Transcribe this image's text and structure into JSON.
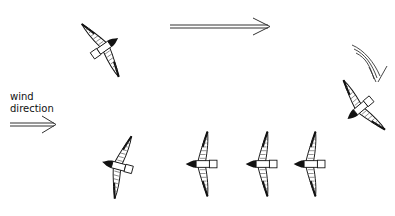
{
  "diagram": {
    "label_line1": "wind",
    "label_line2": "direction",
    "arrows": [
      {
        "name": "wind-direction-arrow",
        "direction": "right"
      },
      {
        "name": "flight-path-arrow",
        "direction": "right"
      },
      {
        "name": "turn-arrow",
        "direction": "curved-down"
      }
    ],
    "birds": [
      {
        "id": 1,
        "position": "top-left",
        "heading": "up-right"
      },
      {
        "id": 2,
        "position": "right",
        "heading": "down-left"
      },
      {
        "id": 3,
        "position": "bottom-right-4",
        "heading": "left"
      },
      {
        "id": 4,
        "position": "bottom-right-3",
        "heading": "left"
      },
      {
        "id": 5,
        "position": "bottom-right-2",
        "heading": "left"
      },
      {
        "id": 6,
        "position": "bottom-right-1",
        "heading": "left"
      },
      {
        "id": 7,
        "position": "bottom-left",
        "heading": "left"
      }
    ],
    "colors": {
      "ink": "#111111",
      "background": "#ffffff"
    }
  }
}
